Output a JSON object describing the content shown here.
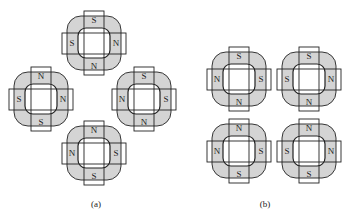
{
  "figure": {
    "panels": [
      {
        "id": "a",
        "caption": "(a)",
        "caption_pos": [
          96,
          207
        ],
        "units": [
          {
            "name": "top",
            "cx": 94,
            "cy": 43,
            "poles": {
              "top": "S",
              "right": "N",
              "bottom": "N",
              "left": "S"
            }
          },
          {
            "name": "left",
            "cx": 41,
            "cy": 99,
            "poles": {
              "top": "N",
              "right": "N",
              "bottom": "S",
              "left": "S"
            }
          },
          {
            "name": "right",
            "cx": 144,
            "cy": 99,
            "poles": {
              "top": "S",
              "right": "S",
              "bottom": "N",
              "left": "N"
            }
          },
          {
            "name": "bottom",
            "cx": 94,
            "cy": 153,
            "poles": {
              "top": "N",
              "right": "S",
              "bottom": "S",
              "left": "N"
            }
          }
        ]
      },
      {
        "id": "b",
        "caption": "(b)",
        "caption_pos": [
          265,
          207
        ],
        "units": [
          {
            "name": "top-left",
            "cx": 239,
            "cy": 79,
            "poles": {
              "top": "S",
              "right": "S",
              "bottom": "N",
              "left": "N"
            }
          },
          {
            "name": "top-right",
            "cx": 309,
            "cy": 79,
            "poles": {
              "top": "S",
              "right": "N",
              "bottom": "N",
              "left": "S"
            }
          },
          {
            "name": "bottom-left",
            "cx": 239,
            "cy": 151,
            "poles": {
              "top": "N",
              "right": "S",
              "bottom": "S",
              "left": "N"
            }
          },
          {
            "name": "bottom-right",
            "cx": 309,
            "cy": 151,
            "poles": {
              "top": "N",
              "right": "N",
              "bottom": "S",
              "left": "S"
            }
          }
        ]
      }
    ],
    "colors": {
      "fill": "#d4d4d4",
      "stroke": "#222222",
      "inner": "#ffffff"
    }
  }
}
